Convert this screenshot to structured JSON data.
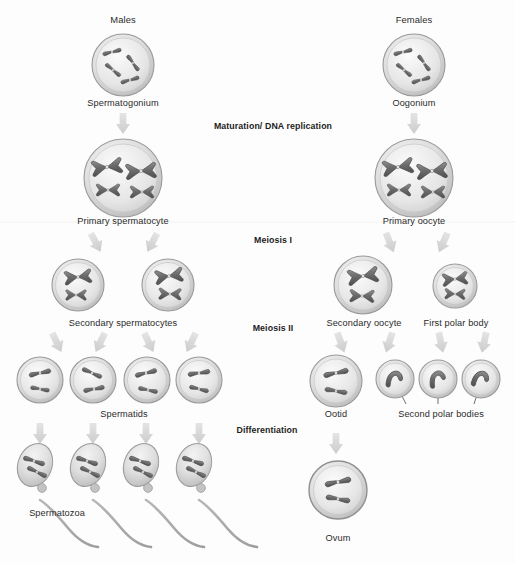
{
  "diagram": {
    "background_color": "#fdfdfd",
    "text_color": "#2b2b2b",
    "cell_fill": "#d9d9d9",
    "chromosome_color": "#6e6e6e",
    "arrow_color": "#d2d2d2"
  },
  "columns": {
    "male_heading": "Males",
    "female_heading": "Females"
  },
  "stage_labels": [
    {
      "id": "maturation",
      "text": "Maturation/ DNA replication",
      "x": 273,
      "y": 126
    },
    {
      "id": "meiosis-1",
      "text": "Meiosis I",
      "x": 273,
      "y": 240
    },
    {
      "id": "meiosis-2",
      "text": "Meiosis II",
      "x": 273,
      "y": 328
    },
    {
      "id": "differentiation",
      "text": "Differentiation",
      "x": 267,
      "y": 430
    }
  ],
  "male_side": {
    "spermatogonium": "Spermatogonium",
    "primary_spermatocyte": "Primary spermatocyte",
    "secondary_spermatocytes": "Secondary spermatocytes",
    "spermatids": "Spermatids",
    "spermatozoa": "Spermatozoa"
  },
  "female_side": {
    "oogonium": "Oogonium",
    "primary_oocyte": "Primary oocyte",
    "secondary_oocyte": "Secondary oocyte",
    "first_polar_body": "First polar body",
    "ootid": "Ootid",
    "second_polar_bodies": "Second polar bodies",
    "ovum": "Ovum"
  },
  "labels": [
    {
      "name": "males-heading",
      "text": "Males",
      "x": 123,
      "y": 19,
      "bold": false,
      "align": "center"
    },
    {
      "name": "females-heading",
      "text": "Females",
      "x": 414,
      "y": 19,
      "bold": false,
      "align": "center"
    },
    {
      "name": "spermatogonium-label",
      "text": "Spermatogonium",
      "x": 123,
      "y": 97,
      "bold": false,
      "align": "center"
    },
    {
      "name": "oogonium-label",
      "text": "Oogonium",
      "x": 414,
      "y": 97,
      "bold": false,
      "align": "center"
    },
    {
      "name": "primary-spermatocyte-label",
      "text": "Primary spermatocyte",
      "x": 123,
      "y": 216,
      "bold": false,
      "align": "center"
    },
    {
      "name": "primary-oocyte-label",
      "text": "Primary oocyte",
      "x": 414,
      "y": 216,
      "bold": false,
      "align": "center"
    },
    {
      "name": "secondary-spermatocytes-label",
      "text": "Secondary spermatocytes",
      "x": 123,
      "y": 318,
      "bold": false,
      "align": "center"
    },
    {
      "name": "secondary-oocyte-label",
      "text": "Secondary oocyte",
      "x": 363,
      "y": 318,
      "bold": false,
      "align": "center"
    },
    {
      "name": "first-polar-body-label",
      "text": "First polar body",
      "x": 455,
      "y": 318,
      "bold": false,
      "align": "center"
    },
    {
      "name": "spermatids-label",
      "text": "Spermatids",
      "x": 124,
      "y": 410,
      "bold": false,
      "align": "center"
    },
    {
      "name": "ootid-label",
      "text": "Ootid",
      "x": 336,
      "y": 410,
      "bold": false,
      "align": "center"
    },
    {
      "name": "second-polar-bodies-label",
      "text": "Second polar bodies",
      "x": 440,
      "y": 411,
      "bold": false,
      "align": "center"
    },
    {
      "name": "spermatozoa-label",
      "text": "Spermatozoa",
      "x": 56,
      "y": 513,
      "bold": false,
      "align": "center"
    },
    {
      "name": "ovum-label",
      "text": "Ovum",
      "x": 338,
      "y": 538,
      "bold": false,
      "align": "center"
    }
  ],
  "cells": {
    "spermatogonium": {
      "cx": 123,
      "cy": 65,
      "r": 31,
      "chromosomes": "4-rods"
    },
    "oogonium": {
      "cx": 414,
      "cy": 65,
      "r": 31,
      "chromosomes": "4-rods"
    },
    "primary_spermatocyte": {
      "cx": 123,
      "cy": 178,
      "r": 39,
      "chromosomes": "4-x"
    },
    "primary_oocyte": {
      "cx": 414,
      "cy": 178,
      "r": 39,
      "chromosomes": "4-x"
    },
    "secondary_spermatocyte_left": {
      "cx": 78,
      "cy": 285,
      "r": 26,
      "chromosomes": "2-x"
    },
    "secondary_spermatocyte_right": {
      "cx": 168,
      "cy": 285,
      "r": 26,
      "chromosomes": "2-x"
    },
    "secondary_oocyte": {
      "cx": 363,
      "cy": 285,
      "r": 29,
      "chromosomes": "2-x"
    },
    "first_polar_body": {
      "cx": 455,
      "cy": 286,
      "r": 22,
      "chromosomes": "2-x"
    },
    "spermatid_1": {
      "cx": 40,
      "cy": 380,
      "r": 23,
      "chromosomes": "2-rods"
    },
    "spermatid_2": {
      "cx": 93,
      "cy": 380,
      "r": 23,
      "chromosomes": "2-rods"
    },
    "spermatid_3": {
      "cx": 147,
      "cy": 380,
      "r": 23,
      "chromosomes": "2-rods"
    },
    "spermatid_4": {
      "cx": 199,
      "cy": 380,
      "r": 23,
      "chromosomes": "2-rods"
    },
    "ootid": {
      "cx": 336,
      "cy": 381,
      "r": 26,
      "chromosomes": "2-rods"
    },
    "polar_body_1": {
      "cx": 395,
      "cy": 379,
      "r": 19,
      "chromosomes": "bent"
    },
    "polar_body_2": {
      "cx": 438,
      "cy": 379,
      "r": 19,
      "chromosomes": "bent"
    },
    "polar_body_3": {
      "cx": 481,
      "cy": 379,
      "r": 19,
      "chromosomes": "bent"
    },
    "ovum": {
      "cx": 338,
      "cy": 490,
      "r": 29,
      "chromosomes": "2-rods"
    }
  },
  "sperm": [
    {
      "name": "spermatozoon-1",
      "hx": 35,
      "hy": 465
    },
    {
      "name": "spermatozoon-2",
      "hx": 88,
      "hy": 465
    },
    {
      "name": "spermatozoon-3",
      "hx": 141,
      "hy": 465
    },
    {
      "name": "spermatozoon-4",
      "hx": 194,
      "hy": 465
    }
  ]
}
